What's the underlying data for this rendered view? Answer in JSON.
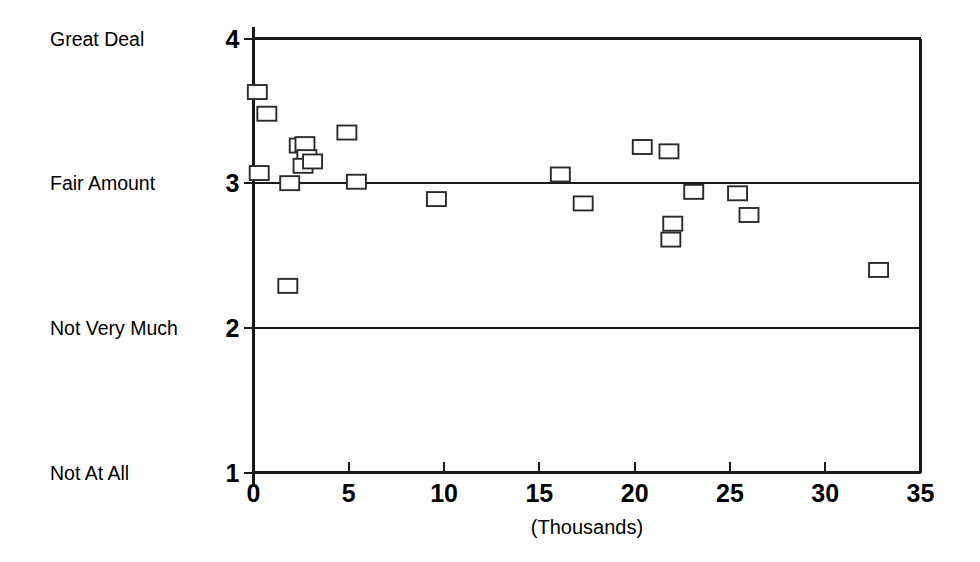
{
  "chart_data": {
    "type": "scatter",
    "title": "",
    "subtitle": "",
    "xlabel": "(Thousands)",
    "ylabel": "",
    "xlim": [
      0,
      35
    ],
    "ylim": [
      1,
      4
    ],
    "grid": "horizontal-at-y3-and-y2",
    "legend": "none",
    "x_ticks": [
      0,
      5,
      10,
      15,
      20,
      25,
      30,
      35
    ],
    "x_tick_labels": [
      "0",
      "5",
      "10",
      "15",
      "20",
      "25",
      "30",
      "35"
    ],
    "y_ticks": [
      1,
      2,
      3,
      4
    ],
    "y_tick_labels": [
      "1",
      "2",
      "3",
      "4"
    ],
    "y_category_labels": [
      {
        "value": 4,
        "label": "Great Deal"
      },
      {
        "value": 3,
        "label": "Fair Amount"
      },
      {
        "value": 2,
        "label": "Not Very Much"
      },
      {
        "value": 1,
        "label": "Not At All"
      }
    ],
    "marker_style": "open-square",
    "marker_color": "#2b2b2b",
    "axis_color": "#1a1a1a",
    "points": [
      {
        "x": 0.2,
        "y": 3.63
      },
      {
        "x": 0.7,
        "y": 3.48
      },
      {
        "x": 0.3,
        "y": 3.07
      },
      {
        "x": 1.9,
        "y": 3.0
      },
      {
        "x": 1.8,
        "y": 2.29
      },
      {
        "x": 2.4,
        "y": 3.26
      },
      {
        "x": 2.7,
        "y": 3.27
      },
      {
        "x": 2.8,
        "y": 3.18
      },
      {
        "x": 2.6,
        "y": 3.12
      },
      {
        "x": 3.1,
        "y": 3.15
      },
      {
        "x": 4.9,
        "y": 3.35
      },
      {
        "x": 5.4,
        "y": 3.01
      },
      {
        "x": 9.6,
        "y": 2.89
      },
      {
        "x": 16.1,
        "y": 3.06
      },
      {
        "x": 17.3,
        "y": 2.86
      },
      {
        "x": 20.4,
        "y": 3.25
      },
      {
        "x": 21.8,
        "y": 3.22
      },
      {
        "x": 22.0,
        "y": 2.72
      },
      {
        "x": 21.9,
        "y": 2.61
      },
      {
        "x": 23.1,
        "y": 2.94
      },
      {
        "x": 25.4,
        "y": 2.93
      },
      {
        "x": 26.0,
        "y": 2.78
      },
      {
        "x": 32.8,
        "y": 2.4
      }
    ]
  }
}
